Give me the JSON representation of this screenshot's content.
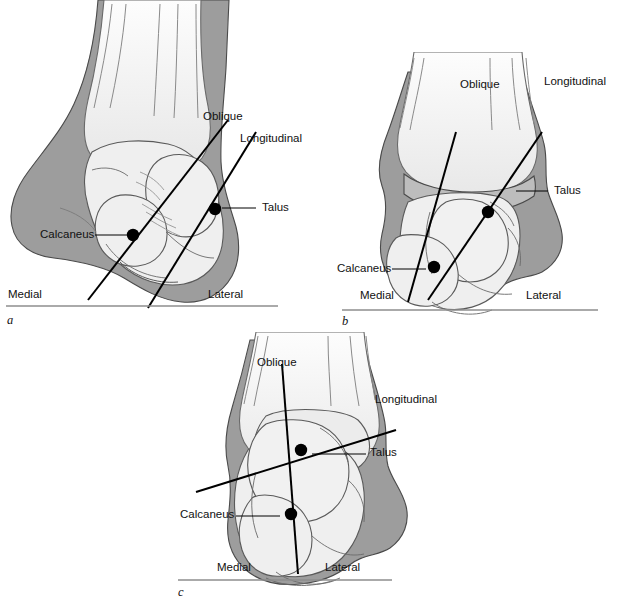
{
  "figure": {
    "type": "anatomical-diagram",
    "panel_count": 3
  },
  "colors": {
    "soft_tissue_dark": "#9d9d9d",
    "soft_tissue_mid": "#c9c9c9",
    "bone_light": "#efefef",
    "bone_lighter": "#f7f7f7",
    "leg_fill": "#ececec",
    "outline": "#4a4a4a",
    "axis_line": "#000000",
    "baseline": "#8e8e8e",
    "text": "#111111"
  },
  "panels": [
    {
      "letter": "a",
      "labels": {
        "oblique": "Oblique",
        "longitudinal": "Longitudinal",
        "talus": "Talus",
        "calcaneus": "Calcaneus",
        "medial": "Medial",
        "lateral": "Lateral"
      }
    },
    {
      "letter": "b",
      "labels": {
        "oblique": "Oblique",
        "longitudinal": "Longitudinal",
        "talus": "Talus",
        "calcaneus": "Calcaneus",
        "medial": "Medial",
        "lateral": "Lateral"
      }
    },
    {
      "letter": "c",
      "labels": {
        "oblique": "Oblique",
        "longitudinal": "Longitudinal",
        "talus": "Talus",
        "calcaneus": "Calcaneus",
        "medial": "Medial",
        "lateral": "Lateral"
      }
    }
  ]
}
